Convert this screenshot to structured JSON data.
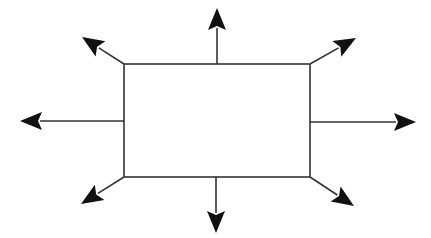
{
  "diagram": {
    "type": "expansion-diagram",
    "colors": {
      "background": "#ffffff",
      "stroke": "#333333",
      "arrowhead": "#111111"
    },
    "rectangle": {
      "x1": 124,
      "y1": 64,
      "x2": 310,
      "y2": 177
    },
    "arrows": [
      {
        "id": "top",
        "from": [
          217,
          64
        ],
        "to": [
          217,
          8
        ]
      },
      {
        "id": "top-left",
        "from": [
          124,
          64
        ],
        "to": [
          82,
          37
        ]
      },
      {
        "id": "top-right",
        "from": [
          310,
          64
        ],
        "to": [
          356,
          38
        ]
      },
      {
        "id": "left",
        "from": [
          124,
          121
        ],
        "to": [
          20,
          121
        ]
      },
      {
        "id": "right",
        "from": [
          310,
          122
        ],
        "to": [
          416,
          122
        ]
      },
      {
        "id": "bottom-left",
        "from": [
          124,
          177
        ],
        "to": [
          81,
          204
        ]
      },
      {
        "id": "bottom",
        "from": [
          216,
          177
        ],
        "to": [
          216,
          233
        ]
      },
      {
        "id": "bottom-right",
        "from": [
          310,
          177
        ],
        "to": [
          354,
          206
        ]
      }
    ]
  }
}
